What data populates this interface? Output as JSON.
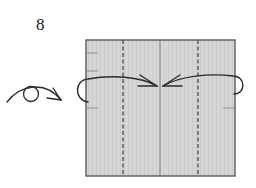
{
  "diagram": {
    "step_number": "8",
    "instruction_type": "turn-over-then-fold",
    "symbols": {
      "turn_over": "turn-over-icon",
      "fold_arrows": "fold-arrow-icon",
      "valley_fold": "dashed-line",
      "crease": "solid-line"
    },
    "paper": {
      "fill_color": "#d4d4d4",
      "edge_color": "#555555"
    },
    "fold_lines": [
      {
        "type": "valley",
        "position": "left-quarter"
      },
      {
        "type": "crease",
        "position": "center"
      },
      {
        "type": "valley",
        "position": "right-quarter"
      }
    ]
  }
}
